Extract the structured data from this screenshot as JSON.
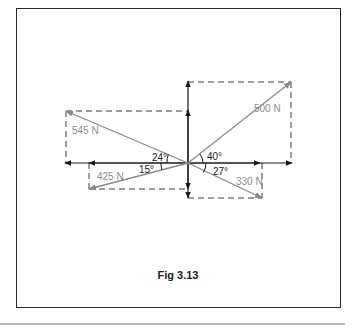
{
  "figure": {
    "caption": "Fig 3.13",
    "colors": {
      "force_vector": "#8a8a8a",
      "axis": "#1a1a1a",
      "dashed": "#3a3a3a",
      "frame": "#2a2a2a"
    }
  },
  "forces": [
    {
      "label": "500 N",
      "angle_label": "40°",
      "quadrant": "upper-right"
    },
    {
      "label": "545 N",
      "angle_label": "24°",
      "quadrant": "upper-left"
    },
    {
      "label": "425 N",
      "angle_label": "15°",
      "quadrant": "lower-left"
    },
    {
      "label": "330 N",
      "angle_label": "27°",
      "quadrant": "lower-right"
    }
  ]
}
